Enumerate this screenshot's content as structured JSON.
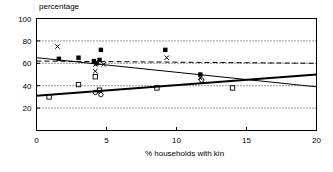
{
  "chart_data": {
    "type": "scatter",
    "title": "percentage",
    "xlabel": "% households with kin",
    "ylabel": "percentage",
    "xlim": [
      0,
      20
    ],
    "ylim": [
      0,
      100
    ],
    "xticks": [
      0,
      5,
      10,
      15,
      20
    ],
    "yticks": [
      20,
      40,
      60,
      80,
      100
    ],
    "grid": "dotted-horizontal",
    "gridlines": [
      20,
      40,
      60,
      80
    ],
    "series": [
      {
        "name": "filled-square",
        "marker": "filled-square",
        "points": [
          [
            1.6,
            64
          ],
          [
            3.0,
            65
          ],
          [
            4.1,
            62
          ],
          [
            4.5,
            63
          ],
          [
            4.3,
            60
          ],
          [
            4.6,
            72
          ],
          [
            9.2,
            72
          ],
          [
            11.7,
            50
          ]
        ]
      },
      {
        "name": "cross",
        "marker": "x",
        "points": [
          [
            1.5,
            75
          ],
          [
            4.2,
            59
          ],
          [
            4.8,
            59
          ],
          [
            4.2,
            53
          ],
          [
            9.3,
            65
          ],
          [
            11.7,
            47
          ]
        ]
      },
      {
        "name": "open-square",
        "marker": "open-square",
        "points": [
          [
            0.9,
            30
          ],
          [
            3.0,
            41
          ],
          [
            4.5,
            36
          ],
          [
            4.2,
            48
          ],
          [
            8.6,
            38
          ],
          [
            14.0,
            38
          ]
        ]
      },
      {
        "name": "open-circle",
        "marker": "open-circle",
        "points": [
          [
            4.2,
            34
          ],
          [
            4.6,
            32
          ],
          [
            11.8,
            45
          ]
        ]
      }
    ],
    "lines": [
      {
        "name": "solid-declining",
        "style": "solid",
        "width": 1,
        "from": [
          0,
          65
        ],
        "to": [
          20,
          39
        ]
      },
      {
        "name": "solid-rising",
        "style": "solid",
        "width": 2,
        "from": [
          0,
          31
        ],
        "to": [
          20,
          50
        ]
      },
      {
        "name": "dashed-flat",
        "style": "dashed",
        "width": 1,
        "from": [
          0,
          62
        ],
        "to": [
          20,
          60
        ]
      }
    ]
  }
}
